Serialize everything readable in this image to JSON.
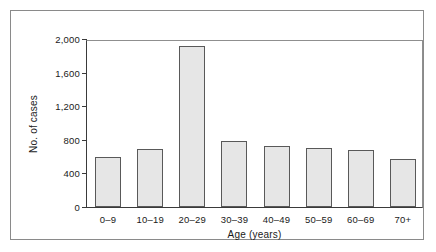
{
  "chart_data": {
    "type": "bar",
    "title": "",
    "xlabel": "Age (years)",
    "ylabel": "No. of cases",
    "categories": [
      "0–9",
      "10–19",
      "20–29",
      "30–39",
      "40–49",
      "50–59",
      "60–69",
      "70+"
    ],
    "values": [
      595,
      690,
      1920,
      790,
      730,
      705,
      680,
      575
    ],
    "series": [
      {
        "name": "No. of cases",
        "values": [
          595,
          690,
          1920,
          790,
          730,
          705,
          680,
          575
        ]
      }
    ],
    "ylim": [
      0,
      2000
    ],
    "yticks": [
      0,
      400,
      800,
      1200,
      1600,
      2000
    ],
    "ytick_labels": [
      "0",
      "400",
      "800",
      "1,200",
      "1,600",
      "2,000"
    ],
    "grid": false,
    "legend": null,
    "bar_color": "#e6e6e6",
    "bar_edge_color": "#595959",
    "axis_color": "#3a3a3a",
    "background": "#ffffff"
  }
}
